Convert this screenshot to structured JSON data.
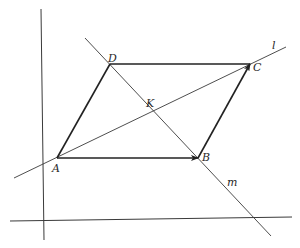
{
  "diagram": {
    "type": "geometry",
    "points": {
      "A": {
        "label": "A",
        "x": 57,
        "y": 158
      },
      "B": {
        "label": "B",
        "x": 198,
        "y": 158
      },
      "C": {
        "label": "C",
        "x": 250,
        "y": 64
      },
      "D": {
        "label": "D",
        "x": 110,
        "y": 64
      },
      "K": {
        "label": "K",
        "x": 153,
        "y": 111
      }
    },
    "lines": {
      "l": {
        "label": "l",
        "through": [
          "A",
          "C"
        ]
      },
      "m": {
        "label": "m",
        "through": [
          "D",
          "K",
          "B"
        ]
      }
    },
    "vectors": [
      {
        "from": "A",
        "to": "B",
        "arrow": true
      },
      {
        "from": "B",
        "to": "C",
        "arrow": true
      }
    ],
    "segments": [
      {
        "from": "A",
        "to": "D"
      },
      {
        "from": "D",
        "to": "C"
      }
    ],
    "axes": {
      "vertical": {
        "x": 41,
        "y1": 9,
        "y2": 240
      },
      "horizontal": {
        "y1": 221,
        "y2": 217,
        "x1": 10,
        "x2": 292
      }
    }
  }
}
